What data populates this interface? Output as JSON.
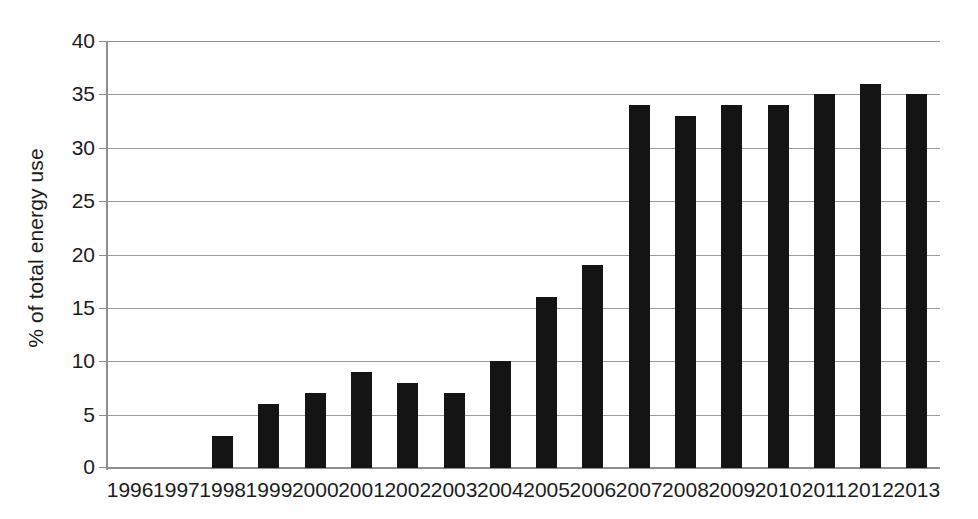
{
  "chart_data": {
    "type": "bar",
    "title": "",
    "subtitle": "",
    "xlabel": "",
    "ylabel": "% of total energy use",
    "categories": [
      "1996",
      "1997",
      "1998",
      "1999",
      "2000",
      "2001",
      "2002",
      "2003",
      "2004",
      "2005",
      "2006",
      "2007",
      "2008",
      "2009",
      "2010",
      "2011",
      "2012",
      "2013"
    ],
    "values": [
      0,
      0,
      3,
      6,
      7,
      9,
      8,
      7,
      10,
      16,
      19,
      34,
      33,
      34,
      34,
      35,
      36,
      35
    ],
    "series": [
      {
        "name": "% of total energy use",
        "values": [
          0,
          0,
          3,
          6,
          7,
          9,
          8,
          7,
          10,
          16,
          19,
          34,
          33,
          34,
          34,
          35,
          36,
          35
        ]
      }
    ],
    "ylim": [
      0,
      40
    ],
    "y_ticks": [
      0,
      5,
      10,
      15,
      20,
      25,
      30,
      35,
      40
    ],
    "y_tick_labels": [
      "0",
      "5",
      "10",
      "15",
      "20",
      "25",
      "30",
      "35",
      "40"
    ],
    "grid": true,
    "grid_axis": "y",
    "legend": false,
    "legend_position": "none",
    "bar_color": "#141414",
    "grid_color": "#9a9a9a",
    "axis_color": "#8e8e8e",
    "background_color": "#ffffff",
    "annotations": []
  }
}
